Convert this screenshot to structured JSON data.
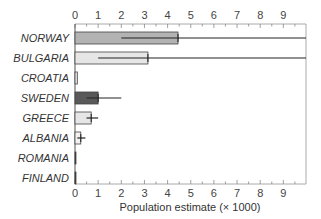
{
  "chart_data": {
    "type": "bar",
    "orientation": "horizontal",
    "title": "",
    "xlabel": "Population estimate (× 1000)",
    "ylabel": "",
    "xlim": [
      0,
      10
    ],
    "x_ticks": [
      0,
      1,
      2,
      3,
      4,
      5,
      6,
      7,
      8,
      9
    ],
    "minor_tick_step": 0.5,
    "grid": false,
    "legend": null,
    "categories": [
      "NORWAY",
      "BULGARIA",
      "CROATIA",
      "SWEDEN",
      "GREECE",
      "ALBANIA",
      "ROMANIA",
      "FINLAND"
    ],
    "values": [
      4.45,
      3.15,
      0.1,
      1.0,
      0.7,
      0.25,
      0.03,
      0.01
    ],
    "error_low": [
      2.0,
      1.0,
      null,
      0.5,
      0.5,
      0.1,
      null,
      null
    ],
    "error_high": [
      10,
      10,
      null,
      2.0,
      1.0,
      0.45,
      null,
      null
    ],
    "bar_colors": [
      "#b3b3b3",
      "#e6e6e6",
      "#e6e6e6",
      "#595959",
      "#e6e6e6",
      "#f2f2f2",
      "#333333",
      "#333333"
    ]
  }
}
